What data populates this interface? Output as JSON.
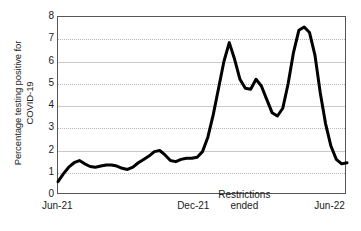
{
  "chart_data": {
    "type": "line",
    "title": "",
    "xlabel": "",
    "ylabel": "Percentage testing positive for COVID-19",
    "ylabel_line1": "Percentage testing positive for",
    "ylabel_line2": "COVID-19",
    "ylim": [
      0,
      8
    ],
    "y_ticks": [
      0,
      1,
      2,
      3,
      4,
      5,
      6,
      7,
      8
    ],
    "y_tick_labels": [
      "0",
      "1",
      "2",
      "3",
      "4",
      "5",
      "6",
      "7",
      "8"
    ],
    "grid": true,
    "legend": "none",
    "line_color": "#000000",
    "line_width": 3,
    "x_ticks": [
      0,
      26,
      52
    ],
    "x_tick_labels": [
      "Jun-21",
      "Dec-21",
      "Jun-22"
    ],
    "xlim": [
      0,
      54
    ],
    "annotations": [
      {
        "name": "restrictions-ended",
        "line1": "Restrictions",
        "line2": "ended",
        "x": 35
      }
    ],
    "x": [
      0,
      1,
      2,
      3,
      4,
      5,
      6,
      7,
      8,
      9,
      10,
      11,
      12,
      13,
      14,
      15,
      16,
      17,
      18,
      19,
      20,
      21,
      22,
      23,
      24,
      25,
      26,
      27,
      28,
      29,
      30,
      31,
      32,
      33,
      34,
      35,
      36,
      37,
      38,
      39,
      40,
      41,
      42,
      43,
      44,
      45,
      46,
      47,
      48,
      49,
      50,
      51,
      52,
      53,
      54
    ],
    "values": [
      0.6,
      0.95,
      1.25,
      1.45,
      1.55,
      1.4,
      1.28,
      1.25,
      1.3,
      1.35,
      1.35,
      1.3,
      1.2,
      1.15,
      1.25,
      1.45,
      1.6,
      1.75,
      1.95,
      2.0,
      1.8,
      1.55,
      1.5,
      1.6,
      1.65,
      1.65,
      1.7,
      1.95,
      2.6,
      3.6,
      4.8,
      6.0,
      6.85,
      6.1,
      5.2,
      4.8,
      4.75,
      5.2,
      4.9,
      4.3,
      3.7,
      3.55,
      3.9,
      5.0,
      6.4,
      7.4,
      7.55,
      7.3,
      6.3,
      4.6,
      3.2,
      2.2,
      1.6,
      1.4,
      1.45
    ],
    "series_name": "Percentage testing positive for COVID-19"
  },
  "axes": {
    "y_title_line1": "Percentage testing positive for",
    "y_title_line2": "COVID-19"
  }
}
